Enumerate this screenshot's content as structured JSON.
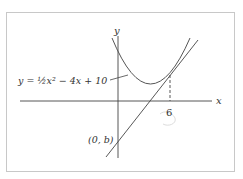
{
  "figure": {
    "equation_label": "y = ½x² − 4x + 10",
    "y_axis_label": "y",
    "x_axis_label": "x",
    "x_tick_label": "6",
    "intercept_label": "(0, b)",
    "curve_color": "#555555",
    "axis_color": "#333333"
  }
}
